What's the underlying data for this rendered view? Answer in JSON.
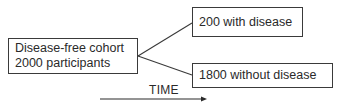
{
  "diagram": {
    "type": "flow",
    "nodes": [
      {
        "id": "cohort",
        "lines": [
          "Disease-free cohort",
          "2000 participants"
        ]
      },
      {
        "id": "with_disease",
        "lines": [
          "200 with disease"
        ]
      },
      {
        "id": "without_disease",
        "lines": [
          "1800 without disease"
        ]
      }
    ],
    "edges": [
      {
        "from": "cohort",
        "to": "with_disease"
      },
      {
        "from": "cohort",
        "to": "without_disease"
      }
    ],
    "time_axis": {
      "label": "TIME",
      "direction": "left-to-right"
    }
  },
  "colors": {
    "line": "#3a3a3a",
    "text": "#2a2a2a",
    "background": "#ffffff"
  }
}
